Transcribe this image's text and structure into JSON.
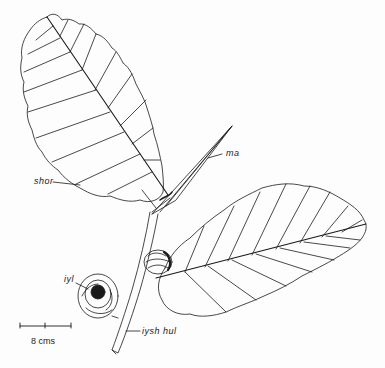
{
  "figure": {
    "labels": {
      "ma": "ma",
      "shor": "shor",
      "iyl": "iyl",
      "iysh_hul": "iysh hul"
    },
    "scale_bar": {
      "label": "8 cms",
      "divisions": 2
    },
    "colors": {
      "ink": "#1a1a1a",
      "paper": "#fdfdfd"
    }
  }
}
